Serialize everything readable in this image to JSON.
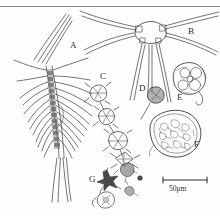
{
  "figure": {
    "type": "scientific-plate",
    "background_color": "#fefefe",
    "ink_color": "#3a3a3a",
    "label_color": "#2b2b2b",
    "top_rule": true
  },
  "panels": [
    {
      "id": "A",
      "label": "A",
      "x": 70,
      "y": 48,
      "subject": "elongate segmented copepod with long setae and forked furcal rami"
    },
    {
      "id": "B",
      "label": "B",
      "x": 188,
      "y": 34,
      "subject": "large stellate cell with radiating spines"
    },
    {
      "id": "C",
      "label": "C",
      "x": 103,
      "y": 80,
      "subject": "chain of angular spiny cells"
    },
    {
      "id": "D",
      "label": "D",
      "x": 142,
      "y": 91,
      "subject": "small round dark cell with stalk"
    },
    {
      "id": "E",
      "label": "E",
      "x": 180,
      "y": 98,
      "subject": "rounded colonial cell cluster"
    },
    {
      "id": "F",
      "label": "F",
      "x": 194,
      "y": 145,
      "subject": "large irregular granular aggregate"
    },
    {
      "id": "G",
      "label": "G",
      "x": 93,
      "y": 180,
      "subject": "star-shaped cell with small flagellates and detritus"
    }
  ],
  "scale_bar": {
    "label": "50μm",
    "text_x": 170,
    "text_y": 193,
    "bar_x1": 163,
    "bar_x2": 207,
    "bar_y": 180
  }
}
